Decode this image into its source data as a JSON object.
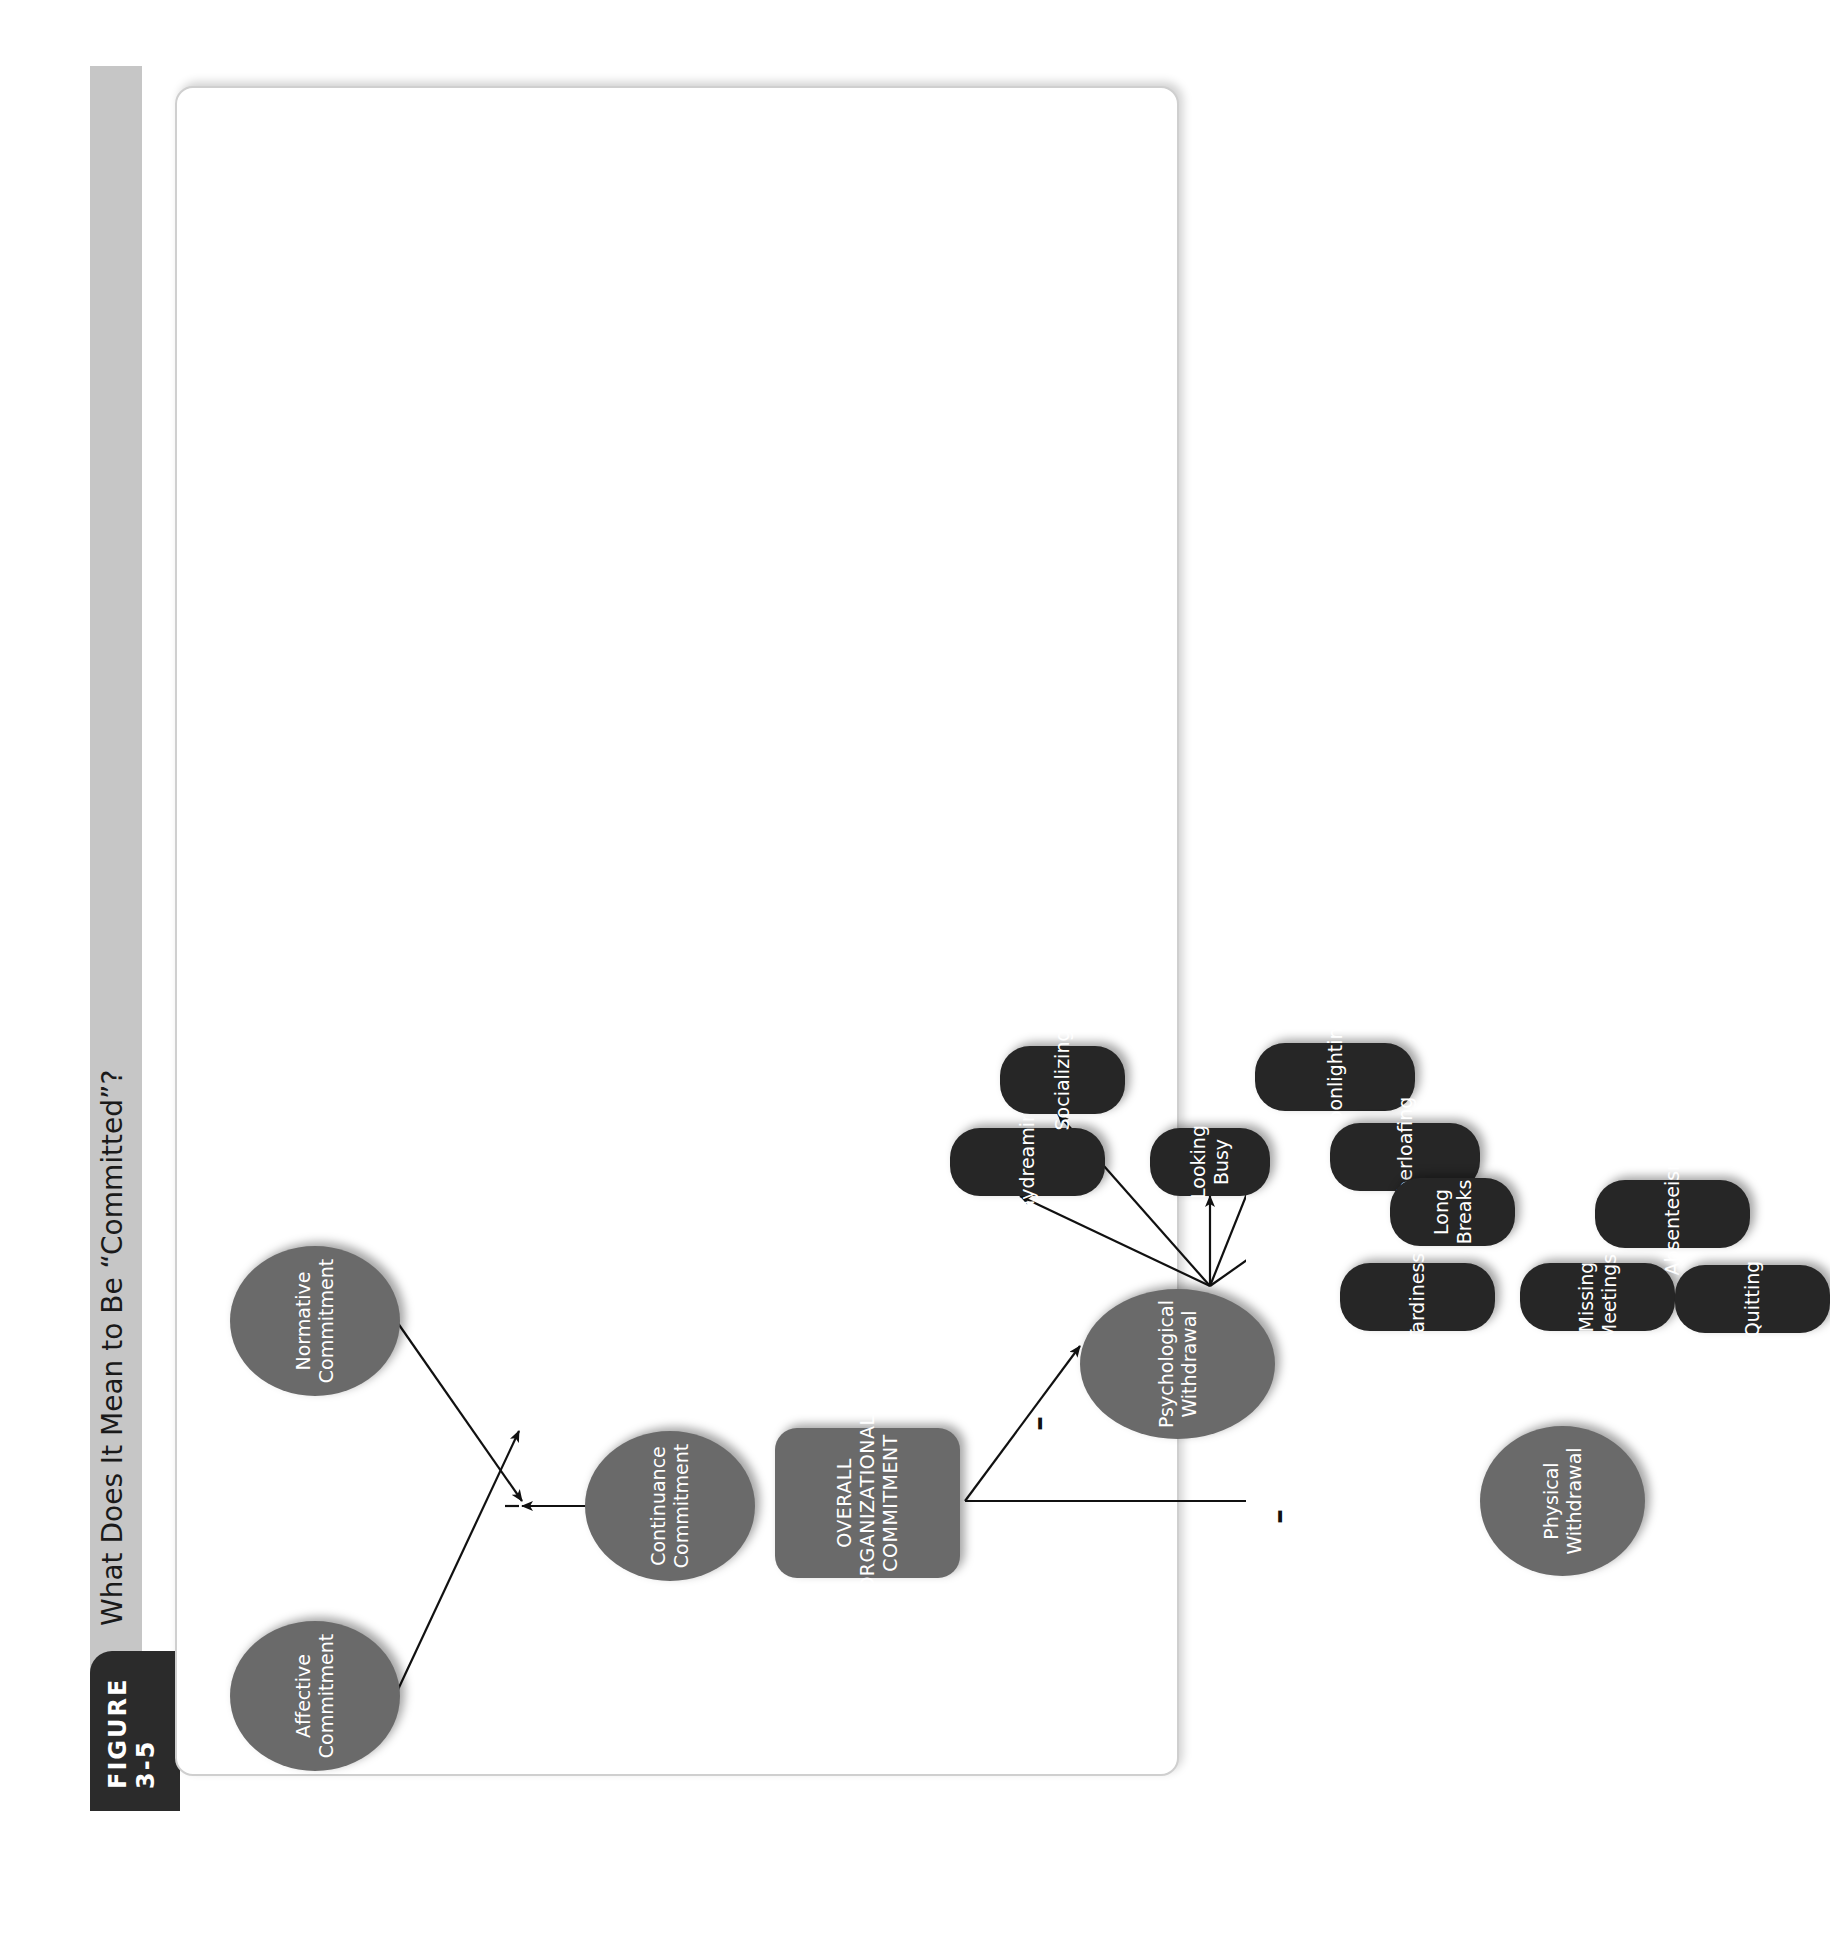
{
  "figure": {
    "label": "FIGURE 3-5",
    "title": "What Does It Mean to Be “Committed”?"
  },
  "nodes": {
    "affective": "Affective\nCommitment",
    "continuance": "Continuance\nCommitment",
    "normative": "Normative\nCommitment",
    "overall": "OVERALL\nORGANIZATIONAL\nCOMMITMENT",
    "psychological": "Psychological\nWithdrawal",
    "physical": "Physical\nWithdrawal",
    "daydreaming": "Daydreaming",
    "socializing": "Socializing",
    "looking_busy": "Looking\nBusy",
    "moonlighting": "Moonlighting",
    "cyberloafing": "Cyberloafing",
    "tardiness": "Tardiness",
    "long_breaks": "Long\nBreaks",
    "missing_meetings": "Missing\nMeetings",
    "absenteeism": "Absenteeism",
    "quitting": "Quitting"
  },
  "relationships": {
    "overall_to_psychological": "–",
    "overall_to_physical": "–"
  },
  "colors": {
    "construct_fill": "#6a6a6a",
    "behavior_fill": "#262626",
    "tab_fill": "#2b2b2b",
    "header_fill": "#c6c6c6"
  }
}
